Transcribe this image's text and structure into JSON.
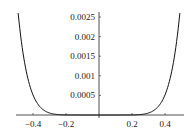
{
  "chart_data": {
    "type": "line",
    "title": "",
    "xlabel": "",
    "ylabel": "",
    "xlim": [
      -0.5,
      0.5
    ],
    "ylim": [
      0,
      0.0026
    ],
    "grid": false,
    "legend": null,
    "x_ticks": [
      "-0.4",
      "-0.2",
      "0.2",
      "0.4"
    ],
    "y_ticks": [
      "0.0005",
      "0.001",
      "0.0015",
      "0.002",
      "0.0025"
    ],
    "series": [
      {
        "name": "curve",
        "x": [
          -0.49,
          -0.45,
          -0.4,
          -0.35,
          -0.3,
          -0.25,
          -0.2,
          -0.15,
          -0.1,
          -0.05,
          0,
          0.05,
          0.1,
          0.15,
          0.2,
          0.25,
          0.3,
          0.35,
          0.4,
          0.45,
          0.49
        ],
        "y": [
          0.0026,
          0.00168,
          0.00084,
          0.00037,
          0.00014,
          4e-05,
          1e-05,
          0.0,
          0.0,
          0.0,
          0.0,
          0.0,
          0.0,
          0.0,
          1e-05,
          4e-05,
          0.00014,
          0.00037,
          0.00084,
          0.00168,
          0.0026
        ]
      }
    ]
  }
}
